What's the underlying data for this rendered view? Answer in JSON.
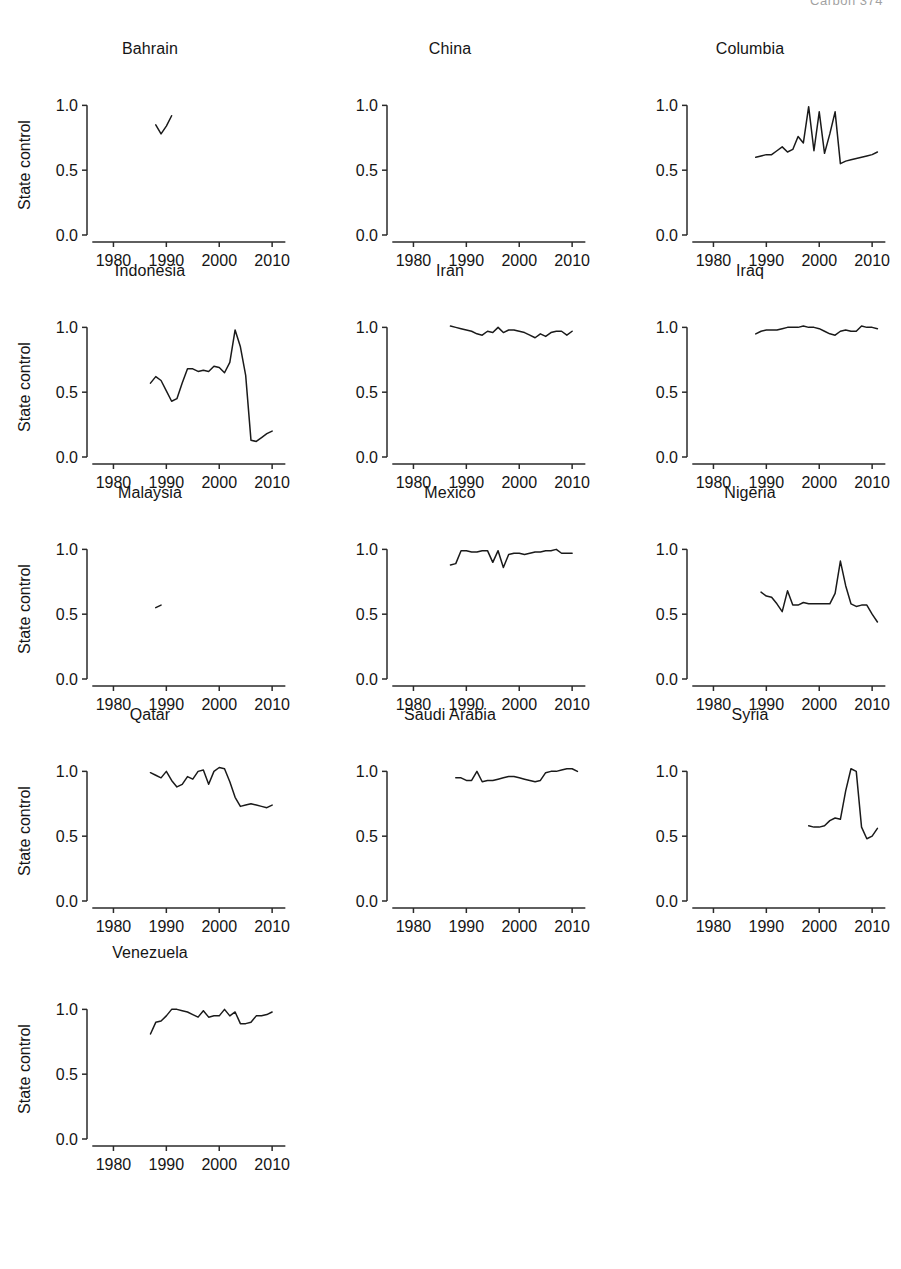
{
  "header": {
    "running_head": "Carbon   374"
  },
  "figure": {
    "y_axis_label": "State control",
    "x_axis_label": "Year",
    "x_ticks": [
      1980,
      1990,
      2000,
      2010
    ],
    "x_tick_labels": [
      "1980",
      "1990",
      "2000",
      "2010"
    ],
    "y_ticks": [
      0.0,
      0.5,
      1.0
    ],
    "y_tick_labels": [
      "0.0",
      "0.5",
      "1.0"
    ],
    "xlim": [
      1975,
      2013
    ],
    "ylim": [
      -0.03,
      1.08
    ],
    "grid": false,
    "legend": "none",
    "n_rows": 5,
    "n_cols": 3,
    "line_color": "#1a1a1a"
  },
  "chart_data": {
    "type": "line",
    "xlabel": "Year",
    "ylabel": "State control",
    "xlim": [
      1975,
      2013
    ],
    "ylim": [
      0.0,
      1.08
    ],
    "grid": false,
    "legend": "none",
    "panels": [
      {
        "name": "Bahrain",
        "x": [
          1988,
          1989,
          1990,
          1991
        ],
        "y": [
          0.85,
          0.78,
          0.84,
          0.92
        ]
      },
      {
        "name": "China",
        "x": [],
        "y": []
      },
      {
        "name": "Columbia",
        "x": [
          1988,
          1989,
          1990,
          1991,
          1992,
          1993,
          1994,
          1995,
          1996,
          1997,
          1998,
          1999,
          2000,
          2001,
          2002,
          2003,
          2004,
          2005,
          2006,
          2007,
          2008,
          2009,
          2010,
          2011
        ],
        "y": [
          0.6,
          0.61,
          0.62,
          0.62,
          0.65,
          0.68,
          0.64,
          0.66,
          0.76,
          0.71,
          0.99,
          0.65,
          0.95,
          0.63,
          0.78,
          0.95,
          0.55,
          0.57,
          0.58,
          0.59,
          0.6,
          0.61,
          0.62,
          0.64
        ]
      },
      {
        "name": "Indonesia",
        "x": [
          1987,
          1988,
          1989,
          1990,
          1991,
          1992,
          1993,
          1994,
          1995,
          1996,
          1997,
          1998,
          1999,
          2000,
          2001,
          2002,
          2003,
          2004,
          2005,
          2006,
          2007,
          2008,
          2009,
          2010
        ],
        "y": [
          0.57,
          0.62,
          0.59,
          0.51,
          0.43,
          0.45,
          0.57,
          0.68,
          0.68,
          0.66,
          0.67,
          0.66,
          0.7,
          0.69,
          0.65,
          0.73,
          0.98,
          0.85,
          0.63,
          0.13,
          0.12,
          0.15,
          0.18,
          0.2
        ]
      },
      {
        "name": "Iran",
        "x": [
          1987,
          1988,
          1989,
          1990,
          1991,
          1992,
          1993,
          1994,
          1995,
          1996,
          1997,
          1998,
          1999,
          2000,
          2001,
          2002,
          2003,
          2004,
          2005,
          2006,
          2007,
          2008,
          2009,
          2010
        ],
        "y": [
          1.01,
          1.0,
          0.99,
          0.98,
          0.97,
          0.95,
          0.94,
          0.97,
          0.96,
          1.0,
          0.96,
          0.98,
          0.98,
          0.97,
          0.96,
          0.94,
          0.92,
          0.95,
          0.93,
          0.96,
          0.97,
          0.97,
          0.94,
          0.97
        ]
      },
      {
        "name": "Iraq",
        "x": [
          1988,
          1989,
          1990,
          1991,
          1992,
          1993,
          1994,
          1995,
          1996,
          1997,
          1998,
          1999,
          2000,
          2001,
          2002,
          2003,
          2004,
          2005,
          2006,
          2007,
          2008,
          2009,
          2010,
          2011
        ],
        "y": [
          0.95,
          0.97,
          0.98,
          0.98,
          0.98,
          0.99,
          1.0,
          1.0,
          1.0,
          1.01,
          1.0,
          1.0,
          0.99,
          0.97,
          0.95,
          0.94,
          0.97,
          0.98,
          0.97,
          0.97,
          1.01,
          1.0,
          1.0,
          0.99
        ]
      },
      {
        "name": "Malaysia",
        "x": [
          1988,
          1989
        ],
        "y": [
          0.55,
          0.57
        ]
      },
      {
        "name": "Mexico",
        "x": [
          1987,
          1988,
          1989,
          1990,
          1991,
          1992,
          1993,
          1994,
          1995,
          1996,
          1997,
          1998,
          1999,
          2000,
          2001,
          2002,
          2003,
          2004,
          2005,
          2006,
          2007,
          2008,
          2009,
          2010
        ],
        "y": [
          0.88,
          0.89,
          0.99,
          0.99,
          0.98,
          0.98,
          0.99,
          0.99,
          0.9,
          0.99,
          0.86,
          0.96,
          0.97,
          0.97,
          0.96,
          0.97,
          0.98,
          0.98,
          0.99,
          0.99,
          1.0,
          0.97,
          0.97,
          0.97
        ]
      },
      {
        "name": "Nigeria",
        "x": [
          1989,
          1990,
          1991,
          1992,
          1993,
          1994,
          1995,
          1996,
          1997,
          1998,
          1999,
          2000,
          2001,
          2002,
          2003,
          2004,
          2005,
          2006,
          2007,
          2008,
          2009,
          2010,
          2011
        ],
        "y": [
          0.67,
          0.64,
          0.63,
          0.58,
          0.52,
          0.68,
          0.57,
          0.57,
          0.59,
          0.58,
          0.58,
          0.58,
          0.58,
          0.58,
          0.66,
          0.91,
          0.72,
          0.58,
          0.56,
          0.57,
          0.57,
          0.5,
          0.44
        ]
      },
      {
        "name": "Qatar",
        "x": [
          1987,
          1988,
          1989,
          1990,
          1991,
          1992,
          1993,
          1994,
          1995,
          1996,
          1997,
          1998,
          1999,
          2000,
          2001,
          2002,
          2003,
          2004,
          2005,
          2006,
          2007,
          2008,
          2009,
          2010
        ],
        "y": [
          0.99,
          0.97,
          0.95,
          1.0,
          0.93,
          0.88,
          0.9,
          0.96,
          0.94,
          1.0,
          1.01,
          0.9,
          1.0,
          1.03,
          1.02,
          0.92,
          0.8,
          0.73,
          0.74,
          0.75,
          0.74,
          0.73,
          0.72,
          0.74
        ]
      },
      {
        "name": "Saudi Arabia",
        "x": [
          1988,
          1989,
          1990,
          1991,
          1992,
          1993,
          1994,
          1995,
          1996,
          1997,
          1998,
          1999,
          2000,
          2001,
          2002,
          2003,
          2004,
          2005,
          2006,
          2007,
          2008,
          2009,
          2010,
          2011
        ],
        "y": [
          0.95,
          0.95,
          0.93,
          0.93,
          1.0,
          0.92,
          0.93,
          0.93,
          0.94,
          0.95,
          0.96,
          0.96,
          0.95,
          0.94,
          0.93,
          0.92,
          0.93,
          0.99,
          1.0,
          1.0,
          1.01,
          1.02,
          1.02,
          1.0
        ]
      },
      {
        "name": "Syria",
        "x": [
          1998,
          1999,
          2000,
          2001,
          2002,
          2003,
          2004,
          2005,
          2006,
          2007,
          2008,
          2009,
          2010,
          2011
        ],
        "y": [
          0.58,
          0.57,
          0.57,
          0.58,
          0.62,
          0.64,
          0.63,
          0.85,
          1.02,
          1.0,
          0.57,
          0.48,
          0.5,
          0.56,
          0.53
        ]
      },
      {
        "name": "Venezuela",
        "x": [
          1987,
          1988,
          1989,
          1990,
          1991,
          1992,
          1993,
          1994,
          1995,
          1996,
          1997,
          1998,
          1999,
          2000,
          2001,
          2002,
          2003,
          2004,
          2005,
          2006,
          2007,
          2008,
          2009,
          2010
        ],
        "y": [
          0.81,
          0.9,
          0.91,
          0.95,
          1.0,
          1.0,
          0.99,
          0.98,
          0.96,
          0.94,
          0.99,
          0.94,
          0.95,
          0.95,
          1.0,
          0.95,
          0.98,
          0.89,
          0.89,
          0.9,
          0.95,
          0.95,
          0.96,
          0.98
        ]
      }
    ]
  }
}
